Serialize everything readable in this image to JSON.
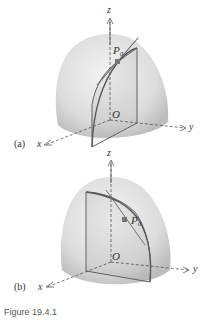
{
  "figure": {
    "caption": "Figure 19.4.1",
    "panels": [
      {
        "id": "a",
        "label": "(a)",
        "axes": {
          "x": "x",
          "y": "y",
          "z": "z"
        },
        "origin_label": "O",
        "point_label": "P₀",
        "description": "Paraboloid dome with vertical plane parallel to yz-plane; tangent line at P0"
      },
      {
        "id": "b",
        "label": "(b)",
        "axes": {
          "x": "x",
          "y": "y",
          "z": "z"
        },
        "origin_label": "O",
        "point_label": "P₀",
        "description": "Paraboloid dome with vertical plane parallel to xz-plane; tangent line at P0"
      }
    ]
  },
  "colors": {
    "dome_center": "#f2f2f2",
    "dome_edge": "#c4c4c4",
    "curve": "#555555",
    "point": "#777777",
    "axis": "#555555"
  }
}
